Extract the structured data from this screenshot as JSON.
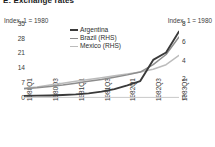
{
  "panel": {
    "label": "E: Exchange rates",
    "left_axis_caption": "Index, 1 = 1980",
    "right_axis_caption": "Index, 1 = 1980"
  },
  "legend": {
    "items": [
      {
        "label": "Argentina",
        "color": "#3a3a3a",
        "swatch": "sw-argentina"
      },
      {
        "label": "Brazil (RHS)",
        "color": "#8d8d8d",
        "swatch": "sw-brazil"
      },
      {
        "label": "Mexico (RHS)",
        "color": "#bcbcbc",
        "swatch": "sw-mexico"
      }
    ]
  },
  "chart_data": {
    "type": "line",
    "title": "E: Exchange rates",
    "xlabel": "",
    "ylabel": "Index, 1 = 1980",
    "y2label": "Index, 1 = 1980",
    "grid": false,
    "legend_position": "top-center",
    "ylim": [
      0,
      35
    ],
    "y2lim": [
      0,
      8
    ],
    "yticks": [
      35,
      28,
      21,
      14,
      7,
      0
    ],
    "y2ticks": [
      8,
      6,
      4,
      2,
      0
    ],
    "x": [
      "1980Q1",
      "1980Q2",
      "1980Q3",
      "1980Q4",
      "1981Q1",
      "1981Q2",
      "1981Q3",
      "1981Q4",
      "1982Q1",
      "1982Q2",
      "1982Q3",
      "1982Q4",
      "1983Q1"
    ],
    "xticks": [
      "1980Q1",
      "1980Q3",
      "1981Q1",
      "1981Q3",
      "1982Q1",
      "1982Q3",
      "1983Q1"
    ],
    "series": [
      {
        "name": "Argentina",
        "axis": "left",
        "color": "#3a3a3a",
        "values": [
          1.0,
          1.1,
          1.2,
          1.4,
          1.7,
          2.2,
          3.0,
          4.2,
          6.0,
          8.0,
          18.0,
          21.5,
          31.5
        ]
      },
      {
        "name": "Brazil (RHS)",
        "axis": "right",
        "color": "#8d8d8d",
        "values": [
          1.0,
          1.1,
          1.25,
          1.4,
          1.6,
          1.8,
          2.0,
          2.25,
          2.5,
          2.8,
          3.6,
          4.7,
          6.6
        ]
      },
      {
        "name": "Mexico (RHS)",
        "axis": "right",
        "color": "#bcbcbc",
        "values": [
          1.05,
          1.2,
          1.4,
          1.6,
          1.8,
          2.0,
          2.2,
          2.4,
          2.6,
          2.8,
          3.1,
          3.6,
          4.6
        ]
      }
    ]
  }
}
